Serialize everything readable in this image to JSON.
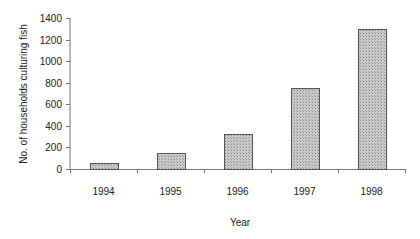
{
  "chart_data": {
    "type": "bar",
    "title": "",
    "xlabel": "Year",
    "ylabel": "No. of households culturing fish",
    "categories": [
      "1994",
      "1995",
      "1996",
      "1997",
      "1998"
    ],
    "values": [
      55,
      150,
      320,
      750,
      1300
    ],
    "ylim": [
      0,
      1400
    ],
    "yticks": [
      0,
      200,
      400,
      600,
      800,
      1000,
      1200,
      1400
    ],
    "grid": false,
    "legend": null
  },
  "colors": {
    "bar_fill": "#c4c4c4",
    "bar_pattern": "#8a8a8a",
    "bar_outline": "#555555",
    "axis": "#777777",
    "text": "#222222"
  }
}
